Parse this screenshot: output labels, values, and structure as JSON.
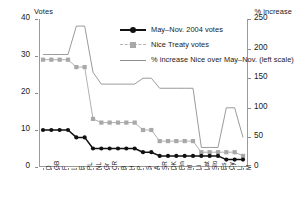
{
  "chart_data": {
    "type": "line",
    "title": "",
    "xlabel": "",
    "ylabel": "Votes",
    "y2label": "% increase",
    "ylim": [
      0,
      40
    ],
    "y2lim": [
      0,
      250
    ],
    "yticks": [
      "0",
      "10",
      "20",
      "30",
      "40"
    ],
    "y2ticks": [
      "0",
      "50",
      "100",
      "150",
      "200",
      "250"
    ],
    "grid": false,
    "legend_position": "upper-center",
    "categories": [
      "D",
      "GB",
      "F",
      "I",
      "E",
      "PL",
      "NL",
      "Gr",
      "CR",
      "B",
      "H",
      "P",
      "S",
      "A",
      "SR",
      "DK",
      "Fin",
      "Irl",
      "Li",
      "Lat",
      "Slo",
      "Es",
      "Cy",
      "L",
      "M"
    ],
    "series": [
      {
        "name": "May–Nov. 2004 votes",
        "axis": "left",
        "color": "#111111",
        "marker": "circle",
        "values": [
          10,
          10,
          10,
          10,
          8,
          8,
          5,
          5,
          5,
          5,
          5,
          5,
          4,
          4,
          3,
          3,
          3,
          3,
          3,
          3,
          3,
          3,
          2,
          2,
          2
        ]
      },
      {
        "name": "Nice Treaty votes",
        "axis": "left",
        "color": "#a8a8a8",
        "marker": "square",
        "values": [
          29,
          29,
          29,
          29,
          27,
          27,
          13,
          12,
          12,
          12,
          12,
          12,
          10,
          10,
          7,
          7,
          7,
          7,
          7,
          4,
          4,
          4,
          4,
          4,
          3
        ]
      },
      {
        "name": "% increase Nice over May–Nov. (left scale)",
        "axis": "right",
        "color": "#8e8e8e",
        "marker": "none",
        "values": [
          190,
          190,
          190,
          190,
          238,
          238,
          160,
          140,
          140,
          140,
          140,
          140,
          150,
          150,
          133,
          133,
          133,
          133,
          133,
          33,
          33,
          33,
          100,
          100,
          50
        ]
      }
    ]
  },
  "axes": {
    "left_title": "Votes",
    "right_title": "% increase"
  },
  "legend": {
    "items": [
      {
        "label": "May–Nov. 2004 votes"
      },
      {
        "label": "Nice Treaty votes"
      },
      {
        "label": "% increase Nice over May–Nov. (left scale)"
      }
    ]
  },
  "colors": {
    "series1": "#111111",
    "series2": "#a8a8a8",
    "series3": "#8e8e8e",
    "axis": "#9a9a9a",
    "text": "#1a1a1a",
    "background": "#ffffff"
  }
}
